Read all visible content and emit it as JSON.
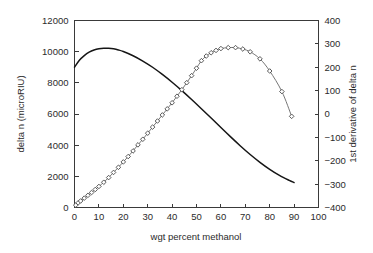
{
  "chart_data": {
    "type": "line",
    "title": "",
    "xlabel": "wgt percent methanol",
    "ylabel": "delta n (microRIU)",
    "y2label": "1st derivative of delta n",
    "xlim": [
      0,
      100
    ],
    "ylim": [
      0,
      12000
    ],
    "y2lim": [
      -400,
      400
    ],
    "xticks": [
      "0",
      "10",
      "20",
      "30",
      "40",
      "50",
      "60",
      "70",
      "80",
      "90",
      "100"
    ],
    "yticks": [
      "0",
      "2000",
      "4000",
      "6000",
      "8000",
      "10000",
      "12000"
    ],
    "y2ticks": [
      "400",
      "300",
      "200",
      "100",
      "0",
      "-100",
      "-200",
      "-300",
      "-400"
    ],
    "grid": false,
    "legend": "none",
    "series": [
      {
        "name": "delta n",
        "axis": "left",
        "style": "solid-line",
        "marker": "none",
        "color": "#151515",
        "x": [
          0,
          2,
          4,
          6,
          8,
          10,
          12,
          14,
          16,
          18,
          20,
          24,
          28,
          32,
          36,
          40,
          44,
          48,
          52,
          56,
          60,
          64,
          68,
          72,
          76,
          80,
          84,
          88,
          90
        ],
        "values": [
          9000,
          9450,
          9750,
          9970,
          10110,
          10190,
          10220,
          10215,
          10180,
          10110,
          10010,
          9740,
          9400,
          9000,
          8540,
          8040,
          7500,
          6930,
          6340,
          5740,
          5130,
          4530,
          3950,
          3400,
          2900,
          2450,
          2060,
          1740,
          1600
        ]
      },
      {
        "name": "1st derivative of delta n",
        "axis": "right",
        "style": "line-with-markers",
        "marker": "open-diamond",
        "color": "#777777",
        "x": [
          0.5,
          1.5,
          2.5,
          4,
          5.5,
          7,
          8.5,
          10,
          12,
          14,
          16,
          18,
          20,
          22,
          24,
          26,
          28,
          30,
          32,
          34,
          36,
          38,
          40,
          42,
          44,
          46,
          48,
          50,
          52,
          54,
          56,
          58,
          60,
          63,
          66,
          69,
          72,
          76,
          80,
          85,
          89
        ],
        "values": [
          -390,
          -380,
          -372,
          -360,
          -348,
          -336,
          -323,
          -310,
          -292,
          -272,
          -250,
          -228,
          -205,
          -182,
          -158,
          -132,
          -108,
          -82,
          -56,
          -30,
          -4,
          22,
          48,
          76,
          104,
          134,
          164,
          196,
          228,
          248,
          262,
          272,
          280,
          284,
          284,
          278,
          266,
          236,
          184,
          96,
          -10
        ]
      }
    ]
  },
  "axes": {
    "left_title": "delta n (microRIU)",
    "right_title": "1st derivative of delta n",
    "bottom_title": "wgt percent methanol"
  }
}
